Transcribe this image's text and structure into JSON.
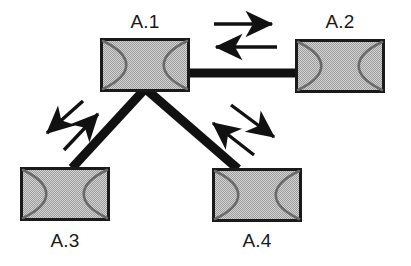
{
  "diagram": {
    "type": "network-topology",
    "canvas": {
      "width": 411,
      "height": 266,
      "background": "#ffffff"
    },
    "colors": {
      "node_fill": "#bdbdbd",
      "node_border": "#1a1a1a",
      "node_curve": "#6a6a6a",
      "link": "#111111",
      "arrow": "#111111",
      "label_text": "#1a1a1a"
    },
    "nodes": [
      {
        "id": "A.1",
        "label": "A.1",
        "role": "hub",
        "x": 100,
        "y": 38,
        "width": 90,
        "height": 54,
        "label_x": 145,
        "label_y": 28
      },
      {
        "id": "A.2",
        "label": "A.2",
        "role": "leaf",
        "x": 295,
        "y": 39,
        "width": 90,
        "height": 54,
        "label_x": 340,
        "label_y": 28
      },
      {
        "id": "A.3",
        "label": "A.3",
        "role": "leaf",
        "x": 20,
        "y": 167,
        "width": 90,
        "height": 54,
        "label_x": 65,
        "label_y": 247
      },
      {
        "id": "A.4",
        "label": "A.4",
        "role": "leaf",
        "x": 212,
        "y": 168,
        "width": 90,
        "height": 54,
        "label_x": 257,
        "label_y": 247
      }
    ],
    "links": [
      {
        "id": "link-a1-a2",
        "from": "A.1",
        "to": "A.2",
        "orientation": "horizontal",
        "thickness": 9,
        "x1": 189,
        "y1": 73,
        "x2": 296,
        "y2": 73
      },
      {
        "id": "link-a1-a3",
        "from": "A.1",
        "to": "A.3",
        "orientation": "diagonal-down-left",
        "thickness": 9,
        "x1": 144,
        "y1": 90,
        "x2": 72,
        "y2": 168
      },
      {
        "id": "link-a1-a4",
        "from": "A.1",
        "to": "A.4",
        "orientation": "diagonal-down-right",
        "thickness": 9,
        "x1": 147,
        "y1": 90,
        "x2": 238,
        "y2": 169
      }
    ],
    "arrows": [
      {
        "id": "arrow-a1-to-a2",
        "link": "link-a1-a2",
        "direction": "right",
        "meaning": "A.1 to A.2",
        "x1": 214,
        "y1": 24,
        "x2": 272,
        "y2": 24
      },
      {
        "id": "arrow-a2-to-a1",
        "link": "link-a1-a2",
        "direction": "left",
        "meaning": "A.2 to A.1",
        "x1": 277,
        "y1": 47,
        "x2": 216,
        "y2": 47
      },
      {
        "id": "arrow-a1-to-a3",
        "link": "link-a1-a3",
        "direction": "down-left",
        "meaning": "A.1 to A.3",
        "x1": 83,
        "y1": 101,
        "x2": 47,
        "y2": 133
      },
      {
        "id": "arrow-a3-to-a1",
        "link": "link-a1-a3",
        "direction": "up-right",
        "meaning": "A.3 to A.1",
        "x1": 64,
        "y1": 150,
        "x2": 98,
        "y2": 114
      },
      {
        "id": "arrow-a1-to-a4",
        "link": "link-a1-a4",
        "direction": "down-right",
        "meaning": "A.1 to A.4",
        "x1": 231,
        "y1": 105,
        "x2": 274,
        "y2": 137
      },
      {
        "id": "arrow-a4-to-a1",
        "link": "link-a1-a4",
        "direction": "up-left",
        "meaning": "A.4 to A.1",
        "x1": 254,
        "y1": 155,
        "x2": 213,
        "y2": 123
      }
    ]
  }
}
